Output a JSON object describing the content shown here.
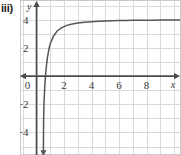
{
  "figure": {
    "part_label": "iii)",
    "background_color": "#ffffff",
    "frame_color": "#c8c8c8",
    "grid_color": "#d9d9d9",
    "axis_color": "#4a4a4a",
    "curve_color": "#555555",
    "tick_text_color": "#3a3a3a"
  },
  "chart_data": {
    "type": "line",
    "title": "",
    "subtitle": "",
    "xlabel": "x",
    "ylabel": "y",
    "xlim": [
      -1.2,
      10.5
    ],
    "ylim": [
      -5.6,
      5.4
    ],
    "grid": true,
    "grid_step_x": 1,
    "grid_step_y": 1,
    "legend": null,
    "x_ticks": [
      0,
      2,
      4,
      6,
      8
    ],
    "x_tick_labels": [
      "0",
      "2",
      "4",
      "6",
      "8"
    ],
    "y_ticks": [
      4,
      2,
      -2,
      -4
    ],
    "y_tick_labels": [
      "4",
      "2",
      "−2",
      "−4"
    ],
    "annotations": [
      "vertical asymptote near x = 0.5",
      "curve approaches y ≈ 4 as x increases",
      "arrowhead at lower end of curve",
      "arrowhead at top of y-axis",
      "arrowhead at left end of x-axis",
      "arrowhead at right end of x-axis"
    ],
    "series": [
      {
        "name": "log-curve",
        "asymptote_x": 0.5,
        "x": [
          0.502,
          0.505,
          0.51,
          0.52,
          0.54,
          0.57,
          0.61,
          0.66,
          0.72,
          0.8,
          0.9,
          1.0,
          1.2,
          1.5,
          1.8,
          2.2,
          2.6,
          3.0,
          3.5,
          4.0,
          4.5,
          5.0,
          5.5,
          6.0,
          6.5,
          7.0,
          7.5,
          8.0,
          8.5,
          9.0,
          9.5,
          10.0,
          10.4
        ],
        "y": [
          -5.4,
          -4.6,
          -3.8,
          -2.95,
          -2.1,
          -1.35,
          -0.6,
          0.1,
          0.72,
          1.35,
          1.92,
          2.3,
          2.78,
          3.2,
          3.42,
          3.6,
          3.7,
          3.76,
          3.82,
          3.86,
          3.89,
          3.91,
          3.93,
          3.94,
          3.95,
          3.955,
          3.96,
          3.965,
          3.97,
          3.975,
          3.98,
          3.98,
          3.985
        ]
      }
    ]
  }
}
